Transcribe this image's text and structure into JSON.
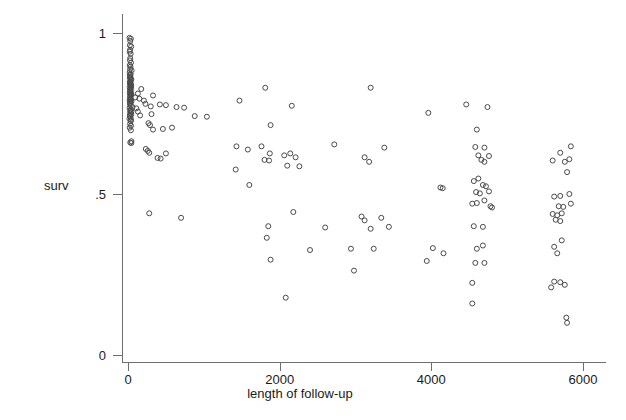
{
  "chart_data": {
    "type": "scatter",
    "title": "",
    "xlabel": "length of follow-up",
    "ylabel": "surv",
    "xlim": [
      -250,
      6250
    ],
    "ylim": [
      0,
      1.03
    ],
    "xticks": [
      0,
      2000,
      4000,
      6000
    ],
    "xticklabels": [
      "0",
      "2000",
      "4000",
      "6000"
    ],
    "yticks": [
      0,
      0.5,
      1
    ],
    "yticklabels": [
      "0",
      ".5",
      "1"
    ],
    "grid": false,
    "legend": null,
    "marker": "open-circle",
    "marker_color": "#4a4a4a",
    "marker_size": 5,
    "n_points": 196,
    "points": [
      [
        20,
        0.985
      ],
      [
        38,
        0.982
      ],
      [
        30,
        0.975
      ],
      [
        25,
        0.962
      ],
      [
        42,
        0.958
      ],
      [
        28,
        0.948
      ],
      [
        22,
        0.942
      ],
      [
        35,
        0.935
      ],
      [
        30,
        0.922
      ],
      [
        26,
        0.915
      ],
      [
        40,
        0.908
      ],
      [
        24,
        0.9
      ],
      [
        33,
        0.895
      ],
      [
        28,
        0.888
      ],
      [
        48,
        0.884
      ],
      [
        22,
        0.878
      ],
      [
        36,
        0.872
      ],
      [
        30,
        0.866
      ],
      [
        26,
        0.86
      ],
      [
        44,
        0.856
      ],
      [
        31,
        0.85
      ],
      [
        25,
        0.845
      ],
      [
        38,
        0.842
      ],
      [
        29,
        0.838
      ],
      [
        34,
        0.834
      ],
      [
        23,
        0.83
      ],
      [
        41,
        0.828
      ],
      [
        27,
        0.824
      ],
      [
        32,
        0.82
      ],
      [
        36,
        0.818
      ],
      [
        24,
        0.815
      ],
      [
        30,
        0.812
      ],
      [
        45,
        0.81
      ],
      [
        26,
        0.806
      ],
      [
        33,
        0.802
      ],
      [
        28,
        0.798
      ],
      [
        39,
        0.794
      ],
      [
        22,
        0.79
      ],
      [
        31,
        0.786
      ],
      [
        25,
        0.78
      ],
      [
        130,
        0.812
      ],
      [
        175,
        0.826
      ],
      [
        95,
        0.8
      ],
      [
        150,
        0.796
      ],
      [
        210,
        0.79
      ],
      [
        330,
        0.806
      ],
      [
        60,
        0.77
      ],
      [
        110,
        0.766
      ],
      [
        36,
        0.762
      ],
      [
        28,
        0.758
      ],
      [
        32,
        0.752
      ],
      [
        44,
        0.748
      ],
      [
        26,
        0.742
      ],
      [
        230,
        0.78
      ],
      [
        300,
        0.772
      ],
      [
        420,
        0.778
      ],
      [
        500,
        0.776
      ],
      [
        130,
        0.756
      ],
      [
        640,
        0.77
      ],
      [
        740,
        0.768
      ],
      [
        1470,
        0.79
      ],
      [
        1810,
        0.83
      ],
      [
        2160,
        0.774
      ],
      [
        3200,
        0.83
      ],
      [
        4460,
        0.778
      ],
      [
        4740,
        0.77
      ],
      [
        3960,
        0.752
      ],
      [
        35,
        0.726
      ],
      [
        28,
        0.718
      ],
      [
        40,
        0.712
      ],
      [
        270,
        0.72
      ],
      [
        290,
        0.714
      ],
      [
        330,
        0.7
      ],
      [
        460,
        0.702
      ],
      [
        1880,
        0.714
      ],
      [
        4600,
        0.7
      ],
      [
        30,
        0.66
      ],
      [
        44,
        0.658
      ],
      [
        235,
        0.64
      ],
      [
        260,
        0.634
      ],
      [
        280,
        0.628
      ],
      [
        390,
        0.612
      ],
      [
        430,
        0.61
      ],
      [
        500,
        0.626
      ],
      [
        1430,
        0.648
      ],
      [
        1580,
        0.638
      ],
      [
        1760,
        0.648
      ],
      [
        1870,
        0.626
      ],
      [
        2060,
        0.62
      ],
      [
        2140,
        0.626
      ],
      [
        2210,
        0.614
      ],
      [
        1800,
        0.606
      ],
      [
        1860,
        0.604
      ],
      [
        2720,
        0.654
      ],
      [
        3120,
        0.614
      ],
      [
        3180,
        0.6
      ],
      [
        3380,
        0.644
      ],
      [
        4580,
        0.646
      ],
      [
        4700,
        0.644
      ],
      [
        4620,
        0.62
      ],
      [
        4760,
        0.618
      ],
      [
        4660,
        0.606
      ],
      [
        4700,
        0.6
      ],
      [
        5600,
        0.604
      ],
      [
        5760,
        0.6
      ],
      [
        5820,
        0.608
      ],
      [
        5700,
        0.628
      ],
      [
        5840,
        0.648
      ],
      [
        5790,
        0.568
      ],
      [
        1420,
        0.576
      ],
      [
        1600,
        0.528
      ],
      [
        4120,
        0.52
      ],
      [
        4150,
        0.518
      ],
      [
        4560,
        0.54
      ],
      [
        4620,
        0.548
      ],
      [
        4680,
        0.528
      ],
      [
        4590,
        0.506
      ],
      [
        4640,
        0.502
      ],
      [
        4720,
        0.524
      ],
      [
        4760,
        0.508
      ],
      [
        4700,
        0.48
      ],
      [
        4600,
        0.472
      ],
      [
        4540,
        0.47
      ],
      [
        4780,
        0.462
      ],
      [
        4800,
        0.458
      ],
      [
        5620,
        0.492
      ],
      [
        5700,
        0.494
      ],
      [
        5820,
        0.5
      ],
      [
        5680,
        0.462
      ],
      [
        5740,
        0.46
      ],
      [
        5840,
        0.47
      ],
      [
        5600,
        0.438
      ],
      [
        5660,
        0.434
      ],
      [
        5720,
        0.44
      ],
      [
        5640,
        0.42
      ],
      [
        5700,
        0.416
      ],
      [
        280,
        0.44
      ],
      [
        700,
        0.426
      ],
      [
        1850,
        0.4
      ],
      [
        2180,
        0.444
      ],
      [
        2600,
        0.396
      ],
      [
        3080,
        0.43
      ],
      [
        3120,
        0.418
      ],
      [
        3200,
        0.392
      ],
      [
        3340,
        0.426
      ],
      [
        3440,
        0.398
      ],
      [
        4560,
        0.4
      ],
      [
        4680,
        0.398
      ],
      [
        1830,
        0.364
      ],
      [
        2940,
        0.33
      ],
      [
        2400,
        0.326
      ],
      [
        3240,
        0.33
      ],
      [
        4020,
        0.332
      ],
      [
        4160,
        0.316
      ],
      [
        4600,
        0.33
      ],
      [
        4680,
        0.34
      ],
      [
        5620,
        0.336
      ],
      [
        5720,
        0.356
      ],
      [
        5660,
        0.316
      ],
      [
        1880,
        0.296
      ],
      [
        3940,
        0.292
      ],
      [
        4580,
        0.286
      ],
      [
        4700,
        0.286
      ],
      [
        2980,
        0.262
      ],
      [
        4540,
        0.224
      ],
      [
        5620,
        0.228
      ],
      [
        5700,
        0.226
      ],
      [
        5580,
        0.21
      ],
      [
        5760,
        0.218
      ],
      [
        2080,
        0.178
      ],
      [
        4540,
        0.16
      ],
      [
        5780,
        0.116
      ],
      [
        5790,
        0.1
      ],
      [
        30,
        0.842
      ],
      [
        42,
        0.836
      ],
      [
        27,
        0.848
      ],
      [
        36,
        0.854
      ],
      [
        31,
        0.862
      ],
      [
        24,
        0.87
      ],
      [
        39,
        0.808
      ],
      [
        33,
        0.782
      ],
      [
        46,
        0.788
      ],
      [
        29,
        0.794
      ],
      [
        37,
        0.774
      ],
      [
        21,
        0.768
      ],
      [
        43,
        0.756
      ],
      [
        26,
        0.746
      ],
      [
        34,
        0.738
      ],
      [
        19,
        0.734
      ],
      [
        41,
        0.73
      ],
      [
        23,
        0.706
      ],
      [
        38,
        0.698
      ],
      [
        45,
        0.664
      ],
      [
        160,
        0.744
      ],
      [
        310,
        0.748
      ],
      [
        580,
        0.706
      ],
      [
        880,
        0.742
      ],
      [
        1040,
        0.74
      ],
      [
        2100,
        0.588
      ],
      [
        2260,
        0.586
      ]
    ]
  },
  "axis": {
    "x_title": "length of follow-up",
    "y_title": "surv"
  }
}
